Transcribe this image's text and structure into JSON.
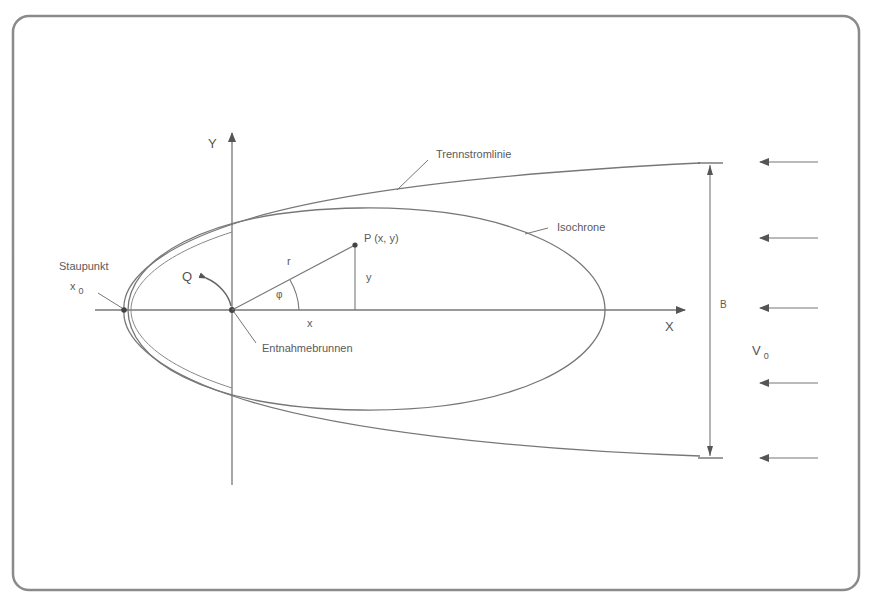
{
  "diagram": {
    "type": "groundwater-capture-zone",
    "labels": {
      "y_axis": "Y",
      "x_axis": "X",
      "separating_streamline": "Trennstromlinie",
      "isochrone": "Isochrone",
      "point": "P (x, y)",
      "radius": "r",
      "y_coord": "y",
      "x_coord": "x",
      "angle": "φ",
      "discharge": "Q",
      "stagnation_point": "Staupunkt",
      "x0_main": "x",
      "x0_sub": "0",
      "well": "Entnahmebrunnen",
      "width": "B",
      "velocity_main": "V",
      "velocity_sub": "0"
    },
    "colors": {
      "line": "#6e6e6e",
      "frame": "#8a8a8a",
      "text": "#5a5a5a"
    },
    "flow_arrow_count": 5
  }
}
